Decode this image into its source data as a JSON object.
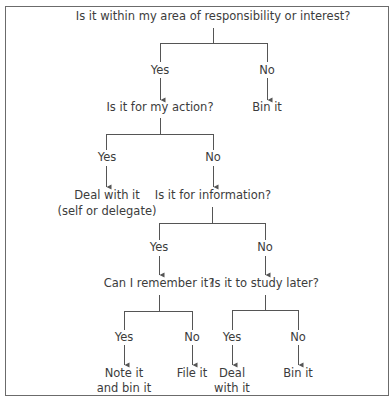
{
  "diagram": {
    "type": "decision-tree",
    "root": {
      "question": "Is it within my area of responsibility or interest?",
      "yes_label": "Yes",
      "no_label": "No",
      "no_outcome": "Bin it",
      "yes_node": {
        "question": "Is it for my action?",
        "yes_label": "Yes",
        "no_label": "No",
        "yes_outcome_line1": "Deal with it",
        "yes_outcome_line2": "(self or delegate)",
        "no_node": {
          "question": "Is it for information?",
          "yes_label": "Yes",
          "no_label": "No",
          "yes_node": {
            "question": "Can I remember it?",
            "yes_label": "Yes",
            "no_label": "No",
            "yes_outcome_line1": "Note it",
            "yes_outcome_line2": "and bin it",
            "no_outcome": "File it"
          },
          "no_node": {
            "question": "Is it to study later?",
            "yes_label": "Yes",
            "no_label": "No",
            "yes_outcome_line1": "Deal",
            "yes_outcome_line2": "with it",
            "no_outcome": "Bin it"
          }
        }
      }
    },
    "colors": {
      "line": "#555555",
      "text": "#3c3c3c",
      "frame": "#6b6b6b"
    }
  }
}
